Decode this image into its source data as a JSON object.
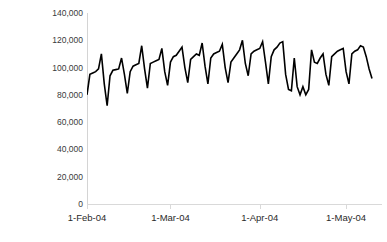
{
  "chart_data": {
    "type": "line",
    "title": "",
    "subtitle": "",
    "xlabel": "",
    "ylabel": "# Vehicles in Tunnel",
    "ylim": [
      0,
      140000
    ],
    "yticks": [
      0,
      20000,
      40000,
      60000,
      80000,
      100000,
      120000,
      140000
    ],
    "ytick_labels": [
      "0",
      "20,000",
      "40,000",
      "60,000",
      "80,000",
      "100,000",
      "120,000",
      "140,000"
    ],
    "xtick_labels": [
      "1-Feb-04",
      "1-Mar-04",
      "1-Apr-04",
      "1-May-04"
    ],
    "xlim_labels": [
      "1-Feb-04",
      "10-May-04"
    ],
    "grid": false,
    "legend": null,
    "legend_position": "none",
    "line_color": "#000000",
    "line_width": 1.6,
    "series_name": "# Vehicles in Tunnel",
    "x_index": [
      0,
      1,
      2,
      3,
      4,
      5,
      6,
      7,
      8,
      9,
      10,
      11,
      12,
      13,
      14,
      15,
      16,
      17,
      18,
      19,
      20,
      21,
      22,
      23,
      24,
      25,
      26,
      27,
      28,
      29,
      30,
      31,
      32,
      33,
      34,
      35,
      36,
      37,
      38,
      39,
      40,
      41,
      42,
      43,
      44,
      45,
      46,
      47,
      48,
      49,
      50,
      51,
      52,
      53,
      54,
      55,
      56,
      57,
      58,
      59,
      60,
      61,
      62,
      63,
      64,
      65,
      66,
      67,
      68,
      69,
      70,
      71,
      72,
      73,
      74,
      75,
      76,
      77,
      78,
      79,
      80,
      81,
      82,
      83,
      84,
      85,
      86,
      87,
      88,
      89,
      90,
      91,
      92,
      93,
      94,
      95,
      96,
      97,
      98,
      99
    ],
    "values": [
      80000,
      95000,
      96000,
      97000,
      99000,
      110000,
      88000,
      72000,
      94000,
      98000,
      98500,
      99000,
      107000,
      95000,
      81000,
      97000,
      101000,
      102000,
      103000,
      116000,
      99000,
      85000,
      103000,
      104000,
      105000,
      106000,
      114000,
      97000,
      87000,
      104000,
      108000,
      109000,
      112000,
      115000,
      100000,
      89000,
      106000,
      108000,
      110000,
      109000,
      118000,
      101000,
      88000,
      107000,
      110000,
      111000,
      112000,
      117000,
      100000,
      89000,
      104000,
      107000,
      110000,
      113000,
      120000,
      103000,
      94000,
      110000,
      112000,
      113000,
      114000,
      119000,
      104000,
      88000,
      108000,
      113000,
      115000,
      118000,
      119000,
      95000,
      84000,
      83000,
      107000,
      86000,
      80000,
      86000,
      80000,
      84000,
      113000,
      104000,
      103000,
      107000,
      110000,
      95000,
      87000,
      108000,
      110000,
      112000,
      113000,
      114000,
      97000,
      88000,
      110000,
      112000,
      113000,
      116000,
      115000,
      108000,
      99000,
      92000
    ]
  },
  "axes": {
    "y_title": "# Vehicles in Tunnel"
  }
}
